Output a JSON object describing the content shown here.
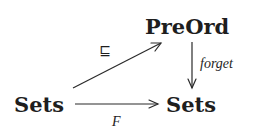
{
  "diagram": {
    "type": "commutative-diagram",
    "nodes": {
      "preord": {
        "label": "PreOrd"
      },
      "sets_left": {
        "label": "Sets"
      },
      "sets_right": {
        "label": "Sets"
      }
    },
    "edges": {
      "inclusion": {
        "from": "Sets",
        "to": "PreOrd",
        "label": "⊑"
      },
      "forget": {
        "from": "PreOrd",
        "to": "Sets",
        "label": "forget"
      },
      "functor": {
        "from": "Sets",
        "to": "Sets",
        "label": "F"
      }
    }
  }
}
